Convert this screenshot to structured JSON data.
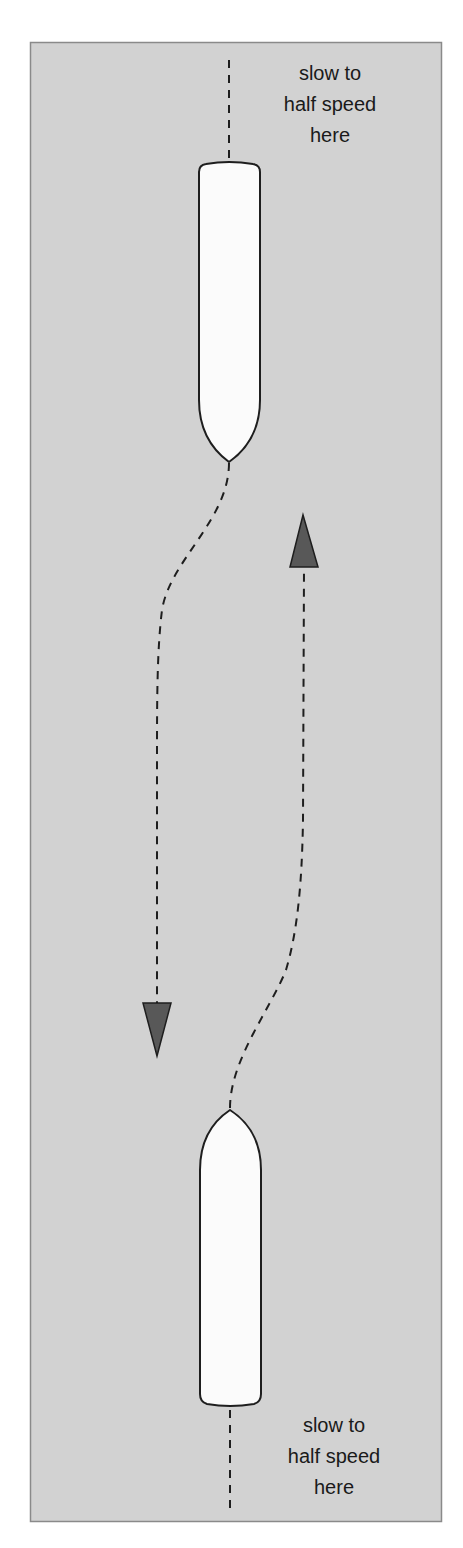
{
  "diagram": {
    "background_color": "#d2d2d2",
    "border_color": "#8a8a8a",
    "boat_fill": "#fbfbfb",
    "arrow_fill": "#585858",
    "line_color": "#1e1e1e",
    "top_label": {
      "lines": [
        "slow to",
        "half speed",
        "here"
      ]
    },
    "bottom_label": {
      "lines": [
        "slow to",
        "half speed",
        "here"
      ]
    },
    "boats": [
      {
        "name": "upper-boat",
        "heading": "down",
        "description": "bow pointing down"
      },
      {
        "name": "lower-boat",
        "heading": "up",
        "description": "bow pointing up"
      }
    ],
    "arrows": [
      {
        "name": "down-arrow",
        "direction": "down"
      },
      {
        "name": "up-arrow",
        "direction": "up"
      }
    ]
  }
}
